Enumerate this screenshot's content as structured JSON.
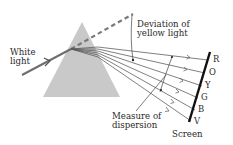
{
  "diagram": {
    "labels": {
      "white_light_line1": "White",
      "white_light_line2": "light",
      "deviation_line1": "Deviation of",
      "deviation_line2": "yellow light",
      "dispersion_line1": "Measure of",
      "dispersion_line2": "dispersion",
      "screen": "Screen"
    },
    "spectrum": [
      "R",
      "O",
      "Y",
      "G",
      "B",
      "V"
    ],
    "colors": {
      "prism_fill": "#c8c8c8",
      "incident_ray": "#6f6f6f",
      "dashed_line": "#7a7a7a",
      "dispersed_rays": "#555555",
      "screen": "#111111",
      "text": "#2a2a2a"
    },
    "elements": {
      "prism": "Triangular prism",
      "incident_ray": "White light ray entering prism",
      "undeviated_path": "Dashed line showing original direction",
      "dispersed_rays": "Six rays fanning out to the screen",
      "screen": "Screen receiving spectrum"
    }
  }
}
